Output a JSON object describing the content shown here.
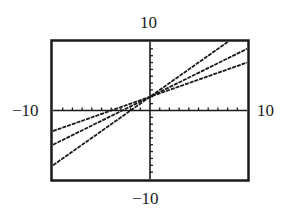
{
  "window": {
    "ymax_label": "10",
    "ymin_label": "−10",
    "xmin_label": "−10",
    "xmax_label": "10"
  },
  "chart_data": {
    "type": "line",
    "title": "",
    "xlabel": "",
    "ylabel": "",
    "xlim": [
      -10,
      10
    ],
    "ylim": [
      -10,
      10
    ],
    "x_tick_step": 1,
    "y_tick_step": 1,
    "grid": false,
    "legend": null,
    "annotations": [
      "10",
      "−10",
      "−10",
      "10"
    ],
    "series": [
      {
        "name": "line 1",
        "equation": "y = x + 2",
        "slope": 1,
        "intercept": 2,
        "x": [
          -10,
          8
        ],
        "y": [
          -8,
          10
        ]
      },
      {
        "name": "line 2",
        "equation": "y = 0.7x + 2",
        "slope": 0.7,
        "intercept": 2,
        "x": [
          -10,
          10
        ],
        "y": [
          -5,
          9
        ]
      },
      {
        "name": "line 3",
        "equation": "y = 0.5x + 2",
        "slope": 0.5,
        "intercept": 2,
        "x": [
          -10,
          10
        ],
        "y": [
          -3,
          7
        ]
      }
    ],
    "colors": {
      "line": "#1a1a1a",
      "frame": "#1a1a1a",
      "background": "#ffffff"
    }
  }
}
